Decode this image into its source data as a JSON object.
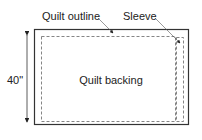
{
  "diagram": {
    "labels": {
      "quilt_outline": "Quilt outline",
      "sleeve": "Sleeve",
      "center": "Quilt backing",
      "dimension": "40\""
    },
    "colors": {
      "outline": "#333333",
      "dashed": "#777777",
      "text": "#222222",
      "background": "#ffffff"
    }
  }
}
